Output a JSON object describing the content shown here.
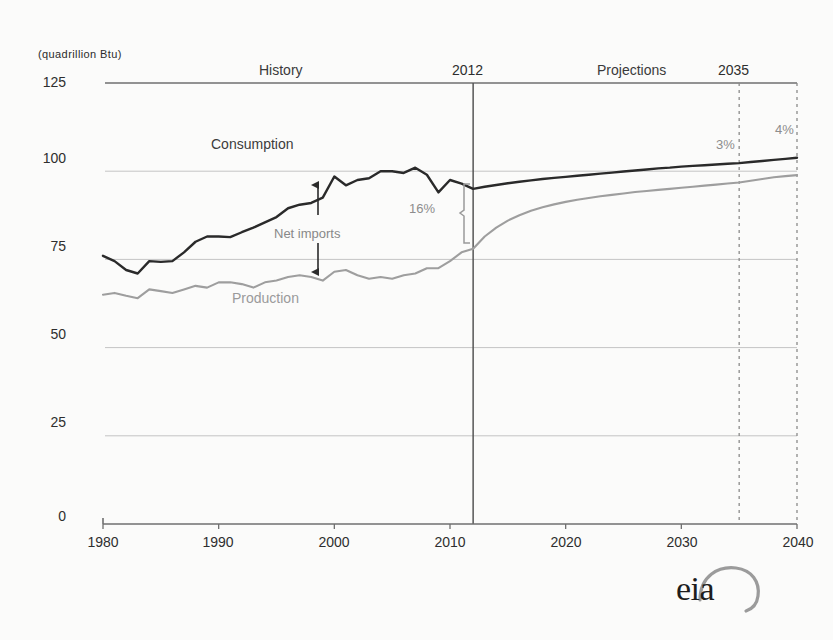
{
  "figure": {
    "background_color": "#fbfbfa",
    "logo": {
      "text": "eia",
      "name": "eia-logo"
    }
  },
  "chart_data": {
    "type": "line",
    "title": "",
    "subtitle": "",
    "xlabel": "",
    "ylabel": "(quadrillion Btu)",
    "units": "quadrillion Btu",
    "xlim": [
      1980,
      2040
    ],
    "ylim": [
      0,
      125
    ],
    "xticks": [
      1980,
      1990,
      2000,
      2010,
      2020,
      2030,
      2040
    ],
    "xtick_labels": [
      "1980",
      "1990",
      "2000",
      "2010",
      "2020",
      "2030",
      "2040"
    ],
    "yticks": [
      0,
      25,
      50,
      75,
      100,
      125
    ],
    "ytick_labels": [
      "0",
      "25",
      "50",
      "75",
      "100",
      "125"
    ],
    "grid": true,
    "grid_axis": "y",
    "legend_position": "inline-labels",
    "history_projection_split": 2012,
    "region_labels": [
      {
        "text": "History",
        "x": 1999
      },
      {
        "text": "Projections",
        "x": 2025
      }
    ],
    "year_markers": [
      {
        "label": "2012",
        "year": 2012,
        "style": "solid"
      },
      {
        "label": "2035",
        "year": 2035,
        "style": "dashed"
      }
    ],
    "vertical_reference_lines": [
      {
        "year": 2012,
        "style": "solid",
        "color": "#555555"
      },
      {
        "year": 2035,
        "style": "dashed",
        "color": "#8a8a8a"
      },
      {
        "year": 2040,
        "style": "dashed",
        "color": "#8a8a8a"
      }
    ],
    "annotations": [
      {
        "name": "net-imports",
        "text": "Net imports",
        "x": 2000,
        "y": 84,
        "type": "double-arrow"
      },
      {
        "name": "gap-2012",
        "text": "16%",
        "x": 2005,
        "y": 87,
        "type": "bracket"
      },
      {
        "name": "gap-2035",
        "text": "3%",
        "x": 2033,
        "y": 106,
        "type": "value"
      },
      {
        "name": "gap-2040",
        "text": "4%",
        "x": 2039,
        "y": 110,
        "type": "value"
      }
    ],
    "series": [
      {
        "name": "Consumption",
        "label": "Consumption",
        "color": "#2a2a2a",
        "label_x": 1992,
        "label_y": 108,
        "x": [
          1980,
          1981,
          1982,
          1983,
          1984,
          1985,
          1986,
          1987,
          1988,
          1989,
          1990,
          1991,
          1992,
          1993,
          1994,
          1995,
          1996,
          1997,
          1998,
          1999,
          2000,
          2001,
          2002,
          2003,
          2004,
          2005,
          2006,
          2007,
          2008,
          2009,
          2010,
          2011,
          2012,
          2013,
          2014,
          2015,
          2016,
          2017,
          2018,
          2019,
          2020,
          2021,
          2022,
          2023,
          2024,
          2025,
          2026,
          2027,
          2028,
          2029,
          2030,
          2031,
          2032,
          2033,
          2034,
          2035,
          2036,
          2037,
          2038,
          2039,
          2040
        ],
        "y": [
          76.0,
          74.5,
          72.0,
          71.0,
          74.5,
          74.3,
          74.5,
          77.0,
          80.0,
          81.5,
          81.5,
          81.3,
          82.7,
          84.0,
          85.5,
          87.0,
          89.5,
          90.5,
          91.0,
          92.5,
          98.5,
          96.0,
          97.5,
          98.0,
          100.0,
          100.0,
          99.5,
          101.0,
          99.0,
          94.0,
          97.5,
          96.5,
          95.0,
          95.6,
          96.1,
          96.6,
          97.0,
          97.4,
          97.8,
          98.1,
          98.4,
          98.7,
          99.0,
          99.3,
          99.6,
          99.9,
          100.2,
          100.5,
          100.8,
          101.0,
          101.3,
          101.5,
          101.7,
          101.9,
          102.1,
          102.3,
          102.6,
          102.9,
          103.2,
          103.5,
          103.8
        ]
      },
      {
        "name": "Production",
        "label": "Production",
        "color": "#9e9e9e",
        "label_x": 1995,
        "label_y": 67,
        "x": [
          1980,
          1981,
          1982,
          1983,
          1984,
          1985,
          1986,
          1987,
          1988,
          1989,
          1990,
          1991,
          1992,
          1993,
          1994,
          1995,
          1996,
          1997,
          1998,
          1999,
          2000,
          2001,
          2002,
          2003,
          2004,
          2005,
          2006,
          2007,
          2008,
          2009,
          2010,
          2011,
          2012,
          2013,
          2014,
          2015,
          2016,
          2017,
          2018,
          2019,
          2020,
          2021,
          2022,
          2023,
          2024,
          2025,
          2026,
          2027,
          2028,
          2029,
          2030,
          2031,
          2032,
          2033,
          2034,
          2035,
          2036,
          2037,
          2038,
          2039,
          2040
        ],
        "y": [
          65.0,
          65.5,
          64.7,
          64.0,
          66.5,
          66.0,
          65.5,
          66.5,
          67.5,
          67.0,
          68.5,
          68.5,
          68.0,
          67.0,
          68.5,
          69.0,
          70.0,
          70.5,
          70.0,
          69.0,
          71.5,
          72.0,
          70.5,
          69.5,
          70.0,
          69.5,
          70.5,
          71.0,
          72.5,
          72.5,
          74.5,
          77.0,
          78.0,
          81.5,
          84.0,
          86.0,
          87.5,
          88.8,
          89.8,
          90.6,
          91.3,
          91.9,
          92.4,
          92.9,
          93.3,
          93.7,
          94.1,
          94.4,
          94.7,
          95.0,
          95.3,
          95.6,
          95.9,
          96.2,
          96.5,
          96.8,
          97.3,
          97.8,
          98.3,
          98.6,
          98.9
        ]
      }
    ]
  }
}
